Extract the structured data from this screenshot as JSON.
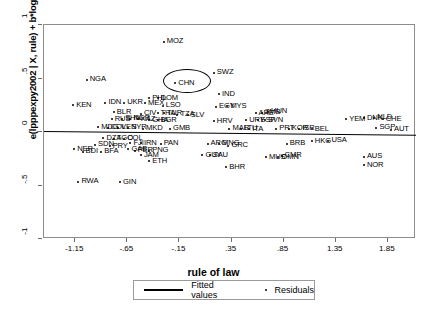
{
  "chart_data": {
    "type": "scatter",
    "title": "",
    "xlabel": "rule of law",
    "ylabel": "e(lpppexpy2002 | X, rule) + b*loghl",
    "xlim": [
      -1.45,
      2.12
    ],
    "ylim": [
      -1.0,
      1.0
    ],
    "grid": false,
    "legend_position": "bottom-center",
    "legend": [
      {
        "label": "Fitted values",
        "marker": "line"
      },
      {
        "label": "Residuals",
        "marker": "dot"
      }
    ],
    "xticks": [
      "-1.15",
      "-.65",
      "-.15",
      ".35",
      ".85",
      "1.35",
      "1.85"
    ],
    "xtick_values": [
      -1.15,
      -0.65,
      -0.15,
      0.35,
      0.85,
      1.35,
      1.85
    ],
    "yticks": [
      "1",
      ".5",
      "0",
      "-.5",
      "-1"
    ],
    "ytick_values": [
      1,
      0.5,
      0,
      -0.5,
      -1
    ],
    "fitted_line": {
      "x0": -1.45,
      "y0": 0.012,
      "x1": 2.12,
      "y1": -0.022
    },
    "annotation": {
      "label": "CHN",
      "shape": "ellipse",
      "note": "circled point"
    },
    "points": [
      {
        "label": "MOZ",
        "x": -0.3,
        "y": 0.845
      },
      {
        "label": "SWZ",
        "x": 0.18,
        "y": 0.555
      },
      {
        "label": "NGA",
        "x": -1.04,
        "y": 0.49
      },
      {
        "label": "CHN",
        "x": -0.19,
        "y": 0.455
      },
      {
        "label": "IND",
        "x": 0.23,
        "y": 0.355
      },
      {
        "label": "PHL",
        "x": -0.44,
        "y": 0.315
      },
      {
        "label": "DOM",
        "x": -0.36,
        "y": 0.315
      },
      {
        "label": "KEN",
        "x": -1.17,
        "y": 0.25
      },
      {
        "label": "IDN",
        "x": -0.86,
        "y": 0.275
      },
      {
        "label": "UKR",
        "x": -0.68,
        "y": 0.275
      },
      {
        "label": "MEX",
        "x": -0.48,
        "y": 0.268
      },
      {
        "label": "LSO",
        "x": -0.31,
        "y": 0.245
      },
      {
        "label": "EGY",
        "x": 0.2,
        "y": 0.235
      },
      {
        "label": "MYS",
        "x": 0.31,
        "y": 0.24
      },
      {
        "label": "BLR",
        "x": -0.78,
        "y": 0.185
      },
      {
        "label": "CIV",
        "x": -0.52,
        "y": 0.17
      },
      {
        "label": "THA",
        "x": -0.36,
        "y": 0.175
      },
      {
        "label": "TUR",
        "x": -0.3,
        "y": 0.175
      },
      {
        "label": "TZA",
        "x": -0.17,
        "y": 0.162
      },
      {
        "label": "SLV",
        "x": -0.07,
        "y": 0.158
      },
      {
        "label": "ARE",
        "x": 0.58,
        "y": 0.175
      },
      {
        "label": "HUN",
        "x": 0.7,
        "y": 0.19
      },
      {
        "label": "ZMB",
        "x": 0.64,
        "y": 0.178
      },
      {
        "label": "RUS",
        "x": -0.8,
        "y": 0.12
      },
      {
        "label": "SHN",
        "x": -0.7,
        "y": 0.122
      },
      {
        "label": "NGR",
        "x": -0.62,
        "y": 0.122
      },
      {
        "label": "KAZ",
        "x": -0.55,
        "y": 0.12
      },
      {
        "label": "GHA",
        "x": -0.44,
        "y": 0.112
      },
      {
        "label": "BGR",
        "x": -0.36,
        "y": 0.11
      },
      {
        "label": "HRV",
        "x": 0.18,
        "y": 0.1
      },
      {
        "label": "URY",
        "x": 0.49,
        "y": 0.112
      },
      {
        "label": "ESP",
        "x": 0.6,
        "y": 0.11
      },
      {
        "label": "SVN",
        "x": 0.67,
        "y": 0.112
      },
      {
        "label": "YEM",
        "x": 1.45,
        "y": 0.12
      },
      {
        "label": "DNK",
        "x": 1.62,
        "y": 0.13
      },
      {
        "label": "NLD",
        "x": 1.72,
        "y": 0.132
      },
      {
        "label": "CHE",
        "x": 1.8,
        "y": 0.118
      },
      {
        "label": "MDG",
        "x": -0.93,
        "y": 0.045
      },
      {
        "label": "COL",
        "x": -0.84,
        "y": 0.04
      },
      {
        "label": "VEN",
        "x": -0.74,
        "y": 0.042
      },
      {
        "label": "SYR",
        "x": -0.64,
        "y": 0.04
      },
      {
        "label": "MKD",
        "x": -0.5,
        "y": 0.032
      },
      {
        "label": "GMB",
        "x": -0.24,
        "y": 0.03
      },
      {
        "label": "MAR",
        "x": 0.33,
        "y": 0.03
      },
      {
        "label": "LTU",
        "x": 0.44,
        "y": 0.03
      },
      {
        "label": "ITA",
        "x": 0.52,
        "y": 0.028
      },
      {
        "label": "PRT",
        "x": 0.78,
        "y": 0.032
      },
      {
        "label": "KOR",
        "x": 0.9,
        "y": 0.03
      },
      {
        "label": "ISR",
        "x": 1.0,
        "y": 0.03
      },
      {
        "label": "BEL",
        "x": 1.12,
        "y": 0.025
      },
      {
        "label": "SGP",
        "x": 1.74,
        "y": 0.04
      },
      {
        "label": "AUT",
        "x": 1.88,
        "y": 0.02
      },
      {
        "label": "DZA",
        "x": -0.88,
        "y": -0.06
      },
      {
        "label": "TGO",
        "x": -0.78,
        "y": -0.065
      },
      {
        "label": "COL",
        "x": -0.68,
        "y": -0.062
      },
      {
        "label": "SDN",
        "x": -0.96,
        "y": -0.12
      },
      {
        "label": "PRY",
        "x": -0.82,
        "y": -0.135
      },
      {
        "label": "FJI",
        "x": -0.62,
        "y": -0.105
      },
      {
        "label": "IRN",
        "x": -0.52,
        "y": -0.105
      },
      {
        "label": "PAN",
        "x": -0.33,
        "y": -0.11
      },
      {
        "label": "ARG",
        "x": 0.12,
        "y": -0.11
      },
      {
        "label": "MNG",
        "x": 0.23,
        "y": -0.11
      },
      {
        "label": "GRC",
        "x": 0.32,
        "y": -0.13
      },
      {
        "label": "BRB",
        "x": 0.88,
        "y": -0.11
      },
      {
        "label": "HKG",
        "x": 1.12,
        "y": -0.085
      },
      {
        "label": "USA",
        "x": 1.28,
        "y": -0.08
      },
      {
        "label": "GAB",
        "x": -0.64,
        "y": -0.16
      },
      {
        "label": "PER",
        "x": -0.58,
        "y": -0.175
      },
      {
        "label": "PNG",
        "x": -0.44,
        "y": -0.175
      },
      {
        "label": "JAM",
        "x": -0.52,
        "y": -0.215
      },
      {
        "label": "SAU",
        "x": 0.14,
        "y": -0.215
      },
      {
        "label": "GUY",
        "x": 0.07,
        "y": -0.218
      },
      {
        "label": "OMN",
        "x": 0.8,
        "y": -0.235
      },
      {
        "label": "MUS",
        "x": 0.68,
        "y": -0.235
      },
      {
        "label": "CMR",
        "x": 0.83,
        "y": -0.222
      },
      {
        "label": "AUS",
        "x": 1.62,
        "y": -0.23
      },
      {
        "label": "NER",
        "x": -1.16,
        "y": -0.16
      },
      {
        "label": "BDI",
        "x": -1.08,
        "y": -0.185
      },
      {
        "label": "BFA",
        "x": -0.9,
        "y": -0.185
      },
      {
        "label": "ETH",
        "x": -0.44,
        "y": -0.275
      },
      {
        "label": "BHR",
        "x": 0.3,
        "y": -0.33
      },
      {
        "label": "NOR",
        "x": 1.62,
        "y": -0.31
      },
      {
        "label": "RWA",
        "x": -1.12,
        "y": -0.465
      },
      {
        "label": "GIN",
        "x": -0.72,
        "y": -0.47
      }
    ]
  }
}
